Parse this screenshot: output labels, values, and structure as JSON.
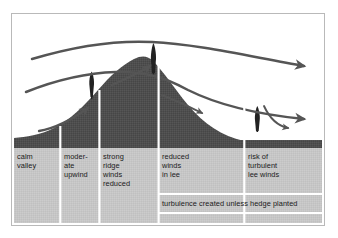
{
  "figure": {
    "type": "cross-section-diagram",
    "frame": {
      "border_color": "#b9b9b9",
      "background": "#ffffff"
    }
  },
  "colors": {
    "hill_fill": "#4e4e4e",
    "panel_fill": "#c6c6c6",
    "divider": "#ffffff",
    "streamline": "#555555",
    "tree": "#222222",
    "text": "#1a1a1a",
    "frame_border": "#b9b9b9"
  },
  "zones": [
    {
      "id": "calm-valley",
      "label": "calm\nvalley",
      "x": 2,
      "width": 46
    },
    {
      "id": "moderate-upwind",
      "label": "moder-\nate\nupwind",
      "x": 49,
      "width": 38
    },
    {
      "id": "strong-ridge",
      "label": "strong\nridge\nwinds\nreduced",
      "x": 88,
      "width": 58
    },
    {
      "id": "reduced-lee",
      "label": "reduced\nwinds\nin lee",
      "x": 147,
      "width": 85
    },
    {
      "id": "turbulent-lee",
      "label": "risk of\nturbulent\nlee winds",
      "x": 233,
      "width": 77
    }
  ],
  "banner": {
    "id": "turbulence-note",
    "label": "turbulence created unless hedge planted",
    "x": 147,
    "width": 163
  },
  "trees": [
    {
      "id": "tree-upwind",
      "x": 78,
      "base_y": 83,
      "height": 26,
      "width": 9
    },
    {
      "id": "tree-ridge",
      "x": 140,
      "base_y": 57,
      "height": 29,
      "width": 9
    },
    {
      "id": "tree-lee",
      "x": 244,
      "base_y": 116,
      "height": 24,
      "width": 9
    }
  ],
  "streamlines": [
    {
      "id": "streamline-upper",
      "description": "uppermost smooth flow over crest, arrow to right edge"
    },
    {
      "id": "streamline-middle",
      "description": "compressed flow accelerating over ridge, arrow to right edge"
    },
    {
      "id": "streamline-lower-upwind",
      "description": "approach flow rising toward upwind tree"
    },
    {
      "id": "streamline-valley",
      "description": "short low valley arrow curving upslope"
    },
    {
      "id": "streamline-lee-descent",
      "description": "short arrow descending the lee slope"
    },
    {
      "id": "streamline-recirculation",
      "description": "curved eddy arrow behind lee hedge"
    }
  ],
  "annotations": {
    "ground_baseline_y": 131,
    "panel_top_y": 134,
    "panel_bottom_y": 209
  }
}
